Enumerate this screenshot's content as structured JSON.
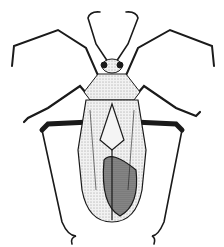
{
  "illustration": {
    "subject": "stippled pen-and-ink drawing of a long-legged true bug (dorsal view)",
    "colors": {
      "ink": "#1a1a1a",
      "background": "#ffffff",
      "body_fill": "#e8e8e8",
      "wing_shade": "#6a6a6a"
    }
  }
}
